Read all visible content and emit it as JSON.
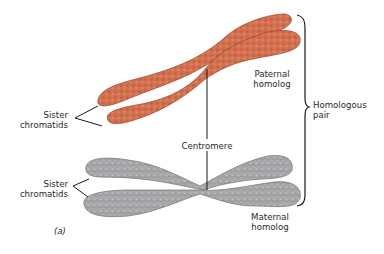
{
  "figure": {
    "panel_label": "(a)",
    "colors": {
      "paternal_fill": "#d3704f",
      "paternal_edge": "#a24a30",
      "maternal_fill": "#a9a9ab",
      "maternal_edge": "#7a7a7d",
      "line": "#1a1a1a",
      "text": "#2a2a2a"
    }
  },
  "labels": {
    "sister_chromatids_top": {
      "line1": "Sister",
      "line2": "chromatids"
    },
    "sister_chromatids_bottom": {
      "line1": "Sister",
      "line2": "chromatids"
    },
    "paternal": {
      "line1": "Paternal",
      "line2": "homolog"
    },
    "maternal": {
      "line1": "Maternal",
      "line2": "homolog"
    },
    "centromere": "Centromere",
    "homologous_pair": {
      "line1": "Homologous",
      "line2": "pair"
    }
  }
}
